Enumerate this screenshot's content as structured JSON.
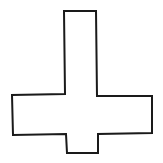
{
  "figure": {
    "stroke_color": "#1a1a1a",
    "fill_color": "#ffffff",
    "background_color": "#ffffff"
  }
}
